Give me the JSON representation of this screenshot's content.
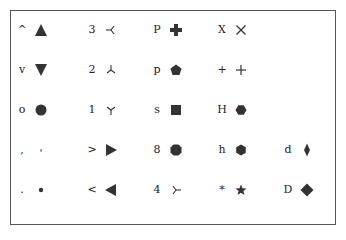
{
  "colors": {
    "marker": "#333333",
    "frame": "#555555",
    "text": "#222222"
  },
  "columns": [
    {
      "items": [
        {
          "code": "^",
          "label": "^",
          "marker": "triangle_up"
        },
        {
          "code": "v",
          "label": "v",
          "marker": "triangle_down"
        },
        {
          "code": "o",
          "label": "o",
          "marker": "circle"
        },
        {
          "code": ",",
          "label": ",",
          "marker": "pixel"
        },
        {
          "code": ".",
          "label": ".",
          "marker": "point"
        }
      ]
    },
    {
      "items": [
        {
          "code": "3",
          "label": "3",
          "marker": "tri_left"
        },
        {
          "code": "2",
          "label": "2",
          "marker": "tri_up"
        },
        {
          "code": "1",
          "label": "1",
          "marker": "tri_down"
        },
        {
          "code": ">",
          "label": ">",
          "marker": "triangle_right"
        },
        {
          "code": "<",
          "label": "<",
          "marker": "triangle_left"
        }
      ]
    },
    {
      "items": [
        {
          "code": "P",
          "label": "P",
          "marker": "plus_filled"
        },
        {
          "code": "p",
          "label": "p",
          "marker": "pentagon"
        },
        {
          "code": "s",
          "label": "s",
          "marker": "square"
        },
        {
          "code": "8",
          "label": "8",
          "marker": "octagon"
        },
        {
          "code": "4",
          "label": "4",
          "marker": "tri_right"
        }
      ]
    },
    {
      "items": [
        {
          "code": "X",
          "label": "X",
          "marker": "x_thin"
        },
        {
          "code": "+",
          "label": "+",
          "marker": "plus"
        },
        {
          "code": "H",
          "label": "H",
          "marker": "hexagon2"
        },
        {
          "code": "h",
          "label": "h",
          "marker": "hexagon1"
        },
        {
          "code": "*",
          "label": "*",
          "marker": "star"
        }
      ]
    },
    {
      "items": [
        null,
        null,
        null,
        {
          "code": "d",
          "label": "d",
          "marker": "thin_diamond"
        },
        {
          "code": "D",
          "label": "D",
          "marker": "diamond"
        }
      ]
    }
  ]
}
